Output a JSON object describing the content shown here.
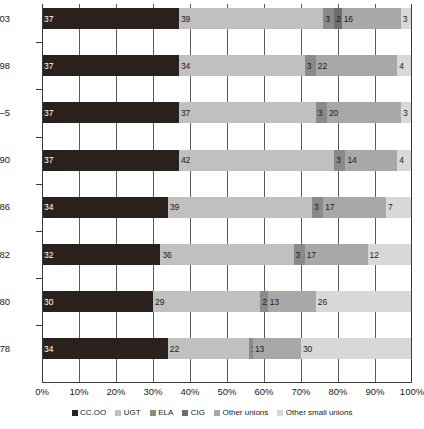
{
  "chart_data": {
    "type": "bar",
    "orientation": "horizontal",
    "stacked": true,
    "stack_mode": "percent",
    "title": "",
    "xlabel": "",
    "ylabel": "",
    "xlim": [
      0,
      100
    ],
    "grid": true,
    "grid_axis": "x",
    "legend_position": "bottom",
    "xticks": [
      "0%",
      "10%",
      "20%",
      "30%",
      "40%",
      "50%",
      "60%",
      "70%",
      "80%",
      "90%",
      "100%"
    ],
    "xtick_values": [
      0,
      10,
      20,
      30,
      40,
      50,
      60,
      70,
      80,
      90,
      100
    ],
    "categories": [
      "2003",
      "1998",
      "1994–5",
      "1990",
      "1986",
      "1982",
      "1980",
      "1978"
    ],
    "series": [
      {
        "name": "CC.OO",
        "color": "#2b211c",
        "values": [
          37,
          37,
          37,
          37,
          34,
          32,
          30,
          34
        ]
      },
      {
        "name": "UGT",
        "color": "#c0c0c0",
        "values": [
          39,
          34,
          37,
          42,
          39,
          36,
          29,
          22
        ]
      },
      {
        "name": "ELA",
        "color": "#8a8a8a",
        "values": [
          3,
          3,
          3,
          3,
          3,
          3,
          2,
          1
        ]
      },
      {
        "name": "CIG",
        "color": "#6e6e6e",
        "values": [
          2,
          0,
          0,
          0,
          0,
          0,
          0,
          0
        ]
      },
      {
        "name": "Other unions",
        "color": "#a8a8a8",
        "values": [
          16,
          22,
          20,
          14,
          17,
          17,
          13,
          13
        ]
      },
      {
        "name": "Other small unions",
        "color": "#d8d8d8",
        "values": [
          3,
          4,
          3,
          4,
          7,
          12,
          26,
          30
        ]
      }
    ],
    "rows": [
      {
        "category": "2003",
        "segments": [
          {
            "series": "CC.OO",
            "value": 37,
            "label": "37"
          },
          {
            "series": "UGT",
            "value": 39,
            "label": "39"
          },
          {
            "series": "ELA",
            "value": 3,
            "label": "3"
          },
          {
            "series": "CIG",
            "value": 2,
            "label": "2"
          },
          {
            "series": "Other unions",
            "value": 16,
            "label": "16"
          },
          {
            "series": "Other small unions",
            "value": 3,
            "label": "3"
          }
        ]
      },
      {
        "category": "1998",
        "segments": [
          {
            "series": "CC.OO",
            "value": 37,
            "label": "37"
          },
          {
            "series": "UGT",
            "value": 34,
            "label": "34"
          },
          {
            "series": "ELA",
            "value": 3,
            "label": "3"
          },
          {
            "series": "CIG",
            "value": 0,
            "label": ""
          },
          {
            "series": "Other unions",
            "value": 22,
            "label": "22"
          },
          {
            "series": "Other small unions",
            "value": 4,
            "label": "4"
          }
        ]
      },
      {
        "category": "1994–5",
        "segments": [
          {
            "series": "CC.OO",
            "value": 37,
            "label": "37"
          },
          {
            "series": "UGT",
            "value": 37,
            "label": "37"
          },
          {
            "series": "ELA",
            "value": 3,
            "label": "3"
          },
          {
            "series": "CIG",
            "value": 0,
            "label": ""
          },
          {
            "series": "Other unions",
            "value": 20,
            "label": "20"
          },
          {
            "series": "Other small unions",
            "value": 3,
            "label": "3"
          }
        ]
      },
      {
        "category": "1990",
        "segments": [
          {
            "series": "CC.OO",
            "value": 37,
            "label": "37"
          },
          {
            "series": "UGT",
            "value": 42,
            "label": "42"
          },
          {
            "series": "ELA",
            "value": 3,
            "label": "3"
          },
          {
            "series": "CIG",
            "value": 0,
            "label": ""
          },
          {
            "series": "Other unions",
            "value": 14,
            "label": "14"
          },
          {
            "series": "Other small unions",
            "value": 4,
            "label": "4"
          }
        ]
      },
      {
        "category": "1986",
        "segments": [
          {
            "series": "CC.OO",
            "value": 34,
            "label": "34"
          },
          {
            "series": "UGT",
            "value": 39,
            "label": "39"
          },
          {
            "series": "ELA",
            "value": 3,
            "label": "3"
          },
          {
            "series": "CIG",
            "value": 0,
            "label": ""
          },
          {
            "series": "Other unions",
            "value": 17,
            "label": "17"
          },
          {
            "series": "Other small unions",
            "value": 7,
            "label": "7"
          }
        ]
      },
      {
        "category": "1982",
        "segments": [
          {
            "series": "CC.OO",
            "value": 32,
            "label": "32"
          },
          {
            "series": "UGT",
            "value": 36,
            "label": "36"
          },
          {
            "series": "ELA",
            "value": 3,
            "label": "3"
          },
          {
            "series": "CIG",
            "value": 0,
            "label": ""
          },
          {
            "series": "Other unions",
            "value": 17,
            "label": "17"
          },
          {
            "series": "Other small unions",
            "value": 12,
            "label": "12"
          }
        ]
      },
      {
        "category": "1980",
        "segments": [
          {
            "series": "CC.OO",
            "value": 30,
            "label": "30"
          },
          {
            "series": "UGT",
            "value": 29,
            "label": "29"
          },
          {
            "series": "ELA",
            "value": 2,
            "label": "2"
          },
          {
            "series": "CIG",
            "value": 0,
            "label": ""
          },
          {
            "series": "Other unions",
            "value": 13,
            "label": "13"
          },
          {
            "series": "Other small unions",
            "value": 26,
            "label": "26"
          }
        ]
      },
      {
        "category": "1978",
        "segments": [
          {
            "series": "CC.OO",
            "value": 34,
            "label": "34"
          },
          {
            "series": "UGT",
            "value": 22,
            "label": "22"
          },
          {
            "series": "ELA",
            "value": 1,
            "label": "1"
          },
          {
            "series": "CIG",
            "value": 0,
            "label": ""
          },
          {
            "series": "Other unions",
            "value": 13,
            "label": "13"
          },
          {
            "series": "Other small unions",
            "value": 30,
            "label": "30"
          }
        ]
      }
    ]
  }
}
